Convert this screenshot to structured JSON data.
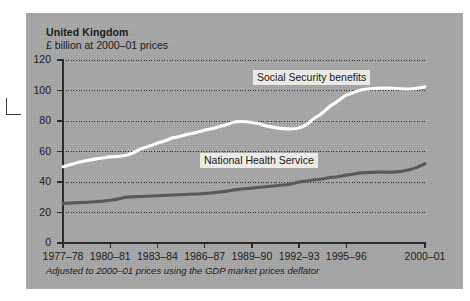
{
  "chart_data": {
    "type": "line",
    "title": "United Kingdom",
    "subtitle": "£ billion at 2000–01 prices",
    "footnote": "Adjusted to 2000–01 prices using the GDP market prices deflator",
    "xlabel": "",
    "ylabel": "£ billion at 2000–01 prices",
    "ylim": [
      0,
      120
    ],
    "yticks": [
      0,
      20,
      40,
      60,
      80,
      100,
      120
    ],
    "grid": "horizontal-dotted",
    "legend": "inline-labels",
    "x": [
      "1977–78",
      "1978–79",
      "1979–80",
      "1980–81",
      "1981–82",
      "1982–83",
      "1983–84",
      "1984–85",
      "1985–86",
      "1986–87",
      "1987–88",
      "1988–89",
      "1989–90",
      "1990–91",
      "1991–92",
      "1992–93",
      "1993–94",
      "1994–95",
      "1995–96",
      "1996–97",
      "1997–98",
      "1998–99",
      "1999–00",
      "2000–01"
    ],
    "xticklabels": [
      "1977–78",
      "1980–81",
      "1983–84",
      "1986–87",
      "1989–90",
      "1992–93",
      "1995–96",
      "2000–01"
    ],
    "xtick_indices": [
      0,
      3,
      6,
      9,
      12,
      15,
      18,
      23
    ],
    "series": [
      {
        "name": "Social Security benefits",
        "color": "#ffffff",
        "values": [
          50.0,
          53.0,
          55.0,
          56.5,
          57.5,
          62.0,
          65.5,
          69.0,
          71.5,
          74.0,
          76.5,
          79.5,
          79.0,
          76.5,
          75.0,
          75.5,
          82.0,
          90.0,
          97.0,
          100.5,
          101.5,
          101.5,
          101.0,
          102.5
        ]
      },
      {
        "name": "National Health Service",
        "color": "#595959",
        "values": [
          26.0,
          26.5,
          27.0,
          28.0,
          30.0,
          30.5,
          31.0,
          31.5,
          32.0,
          32.5,
          33.5,
          35.0,
          36.0,
          37.0,
          38.0,
          40.0,
          41.5,
          43.0,
          44.5,
          46.0,
          46.5,
          46.5,
          48.0,
          52.0
        ]
      }
    ],
    "series_label_positions": [
      {
        "name": "Social Security benefits",
        "x": 253,
        "y": 70
      },
      {
        "name": "National Health Service",
        "x": 200,
        "y": 153
      }
    ]
  }
}
